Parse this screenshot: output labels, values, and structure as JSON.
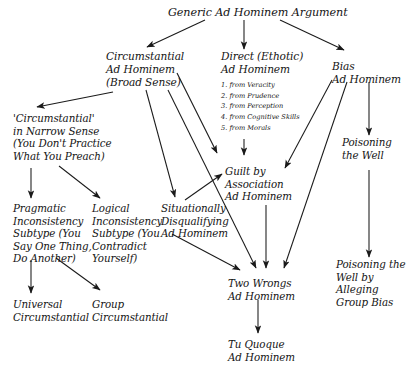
{
  "diagram": {
    "background_color": "#ffffff",
    "text_color": "#141414",
    "edge_color": "#1a1a1a",
    "nodes": {
      "generic": "Generic Ad Hominem Argument",
      "circumstantial_broad": "Circumstantial\nAd Hominem\n(Broad Sense)",
      "direct_ethotic": "Direct (Ethotic)\nAd Hominem",
      "bias": "Bias\nAd Hominem",
      "circumstantial_narrow": "'Circumstantial'\nin Narrow Sense\n(You Don't Practice\nWhat You Preach)",
      "guilt_by_association": "Guilt by\nAssociation\nAd Hominem",
      "poisoning_the_well": "Poisoning\nthe Well",
      "pragmatic_inconsistency": "Pragmatic\nInconsistency\nSubtype (You\nSay One Thing,\nDo Another)",
      "logical_inconsistency": "Logical\nInconsistency\nSubtype (You\nContradict\nYourself)",
      "situationally_disqualifying": "Situationally\nDisqualifying\nAd Hominem",
      "two_wrongs": "Two Wrongs\nAd Hominem",
      "poisoning_well_group_bias": "Poisoning the\nWell by Alleging\nGroup Bias",
      "universal_circumstantial": "Universal\nCircumstantial",
      "group_circumstantial": "Group\nCircumstantial",
      "tu_quoque": "Tu Quoque\nAd Hominem"
    },
    "direct_ethotic_subtypes": "1. from Veracity\n2. from Prudence\n3. from Perception\n4. from Cognitive Skills\n5. from Morals",
    "direct_ethotic_subtype_list": [
      "1. from Veracity",
      "2. from Prudence",
      "3. from Perception",
      "4. from Cognitive Skills",
      "5. from Morals"
    ],
    "edges": [
      {
        "from": "generic",
        "to": "circumstantial_broad"
      },
      {
        "from": "generic",
        "to": "direct_ethotic"
      },
      {
        "from": "generic",
        "to": "bias"
      },
      {
        "from": "circumstantial_broad",
        "to": "circumstantial_narrow"
      },
      {
        "from": "circumstantial_broad",
        "to": "situationally_disqualifying"
      },
      {
        "from": "circumstantial_broad",
        "to": "guilt_by_association"
      },
      {
        "from": "circumstantial_broad",
        "to": "two_wrongs"
      },
      {
        "from": "direct_ethotic",
        "to": "guilt_by_association"
      },
      {
        "from": "bias",
        "to": "guilt_by_association"
      },
      {
        "from": "bias",
        "to": "two_wrongs"
      },
      {
        "from": "bias",
        "to": "poisoning_the_well"
      },
      {
        "from": "circumstantial_narrow",
        "to": "pragmatic_inconsistency"
      },
      {
        "from": "circumstantial_narrow",
        "to": "logical_inconsistency"
      },
      {
        "from": "situationally_disqualifying",
        "to": "guilt_by_association"
      },
      {
        "from": "situationally_disqualifying",
        "to": "two_wrongs"
      },
      {
        "from": "guilt_by_association",
        "to": "two_wrongs"
      },
      {
        "from": "pragmatic_inconsistency",
        "to": "universal_circumstantial"
      },
      {
        "from": "pragmatic_inconsistency",
        "to": "group_circumstantial"
      },
      {
        "from": "poisoning_the_well",
        "to": "poisoning_well_group_bias"
      },
      {
        "from": "two_wrongs",
        "to": "tu_quoque"
      }
    ]
  }
}
